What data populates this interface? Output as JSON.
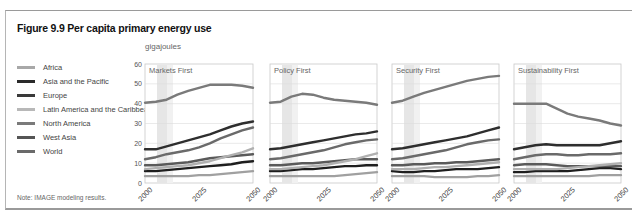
{
  "figure": {
    "title": "Figure 9.9 Per capita primary energy use",
    "unit_label": "gigajoules",
    "note": "Note: IMAGE modeling results."
  },
  "legend": [
    {
      "label": "Africa",
      "color": "#a8a8a8"
    },
    {
      "label": "Asia and the Pacific",
      "color": "#2a2a2a"
    },
    {
      "label": "Europe",
      "color": "#3a3a3a"
    },
    {
      "label": "Latin America and the Caribbean",
      "color": "#b8b8b8"
    },
    {
      "label": "North America",
      "color": "#7a7a7a"
    },
    {
      "label": "West Asia",
      "color": "#555555"
    },
    {
      "label": "World",
      "color": "#6a6a6a"
    }
  ],
  "chart_data": [
    {
      "type": "line",
      "title": "Markets First",
      "xlabel": "",
      "ylabel": "gigajoules",
      "x": [
        2000,
        2005,
        2010,
        2015,
        2020,
        2025,
        2030,
        2035,
        2040,
        2045,
        2050
      ],
      "xticks": [
        "2000",
        "2025",
        "2050"
      ],
      "yticks": [
        0,
        10,
        20,
        30,
        40,
        50,
        60
      ],
      "ylim": [
        0,
        60
      ],
      "grid": true,
      "series": [
        {
          "name": "North America",
          "values": [
            40.5,
            41,
            42,
            44.5,
            46.5,
            48,
            49.5,
            49.5,
            49.5,
            49,
            48
          ]
        },
        {
          "name": "Europe",
          "values": [
            17,
            17,
            18.5,
            20,
            21.5,
            23,
            24.5,
            26.5,
            28.5,
            30,
            31
          ]
        },
        {
          "name": "West Asia",
          "values": [
            12,
            13,
            14.5,
            15.5,
            16.5,
            18,
            20,
            22.5,
            24.5,
            26.5,
            28
          ]
        },
        {
          "name": "Latin America and the Caribbean",
          "values": [
            7,
            7.5,
            8,
            8.5,
            9,
            10,
            11,
            12.5,
            14,
            15.5,
            17.5
          ]
        },
        {
          "name": "World",
          "values": [
            9,
            9,
            9.5,
            10,
            10.5,
            11.5,
            12.5,
            13,
            13.5,
            14,
            14.5
          ]
        },
        {
          "name": "Asia and the Pacific",
          "values": [
            6,
            6,
            6.5,
            7,
            7.5,
            8,
            8.5,
            9,
            9.5,
            10.5,
            11
          ]
        },
        {
          "name": "Africa",
          "values": [
            3.5,
            3.5,
            3.5,
            3.5,
            3.5,
            4,
            4,
            4.5,
            5,
            5.5,
            6
          ]
        }
      ]
    },
    {
      "type": "line",
      "title": "Policy First",
      "x": [
        2000,
        2005,
        2010,
        2015,
        2020,
        2025,
        2030,
        2035,
        2040,
        2045,
        2050
      ],
      "xticks": [
        "2000",
        "2025",
        "2050"
      ],
      "ylim": [
        0,
        60
      ],
      "grid": true,
      "series": [
        {
          "name": "North America",
          "values": [
            40.5,
            41,
            43.5,
            45,
            44.5,
            43,
            42,
            41.5,
            41,
            40.5,
            39.5
          ]
        },
        {
          "name": "Europe",
          "values": [
            17,
            17.5,
            18.5,
            19.5,
            20.5,
            21.5,
            22.5,
            23.5,
            24.5,
            25,
            26
          ]
        },
        {
          "name": "West Asia",
          "values": [
            12,
            12.5,
            13.5,
            14.5,
            15.5,
            16.5,
            18,
            19.5,
            20.5,
            21.5,
            22
          ]
        },
        {
          "name": "Latin America and the Caribbean",
          "values": [
            7,
            7,
            7.5,
            8,
            8.5,
            9,
            10,
            11,
            12,
            13.5,
            15
          ]
        },
        {
          "name": "World",
          "values": [
            9,
            9,
            9.5,
            10,
            10,
            10.5,
            11,
            11.5,
            12,
            12,
            12
          ]
        },
        {
          "name": "Asia and the Pacific",
          "values": [
            6,
            6,
            6.5,
            7,
            7,
            7.5,
            8,
            8.5,
            8.5,
            9,
            9
          ]
        },
        {
          "name": "Africa",
          "values": [
            3.5,
            3.5,
            3.5,
            3.5,
            3.5,
            3.5,
            3.5,
            4,
            4.5,
            5,
            5.5
          ]
        }
      ]
    },
    {
      "type": "line",
      "title": "Security First",
      "x": [
        2000,
        2005,
        2010,
        2015,
        2020,
        2025,
        2030,
        2035,
        2040,
        2045,
        2050
      ],
      "xticks": [
        "2000",
        "2025",
        "2050"
      ],
      "ylim": [
        0,
        60
      ],
      "grid": true,
      "series": [
        {
          "name": "North America",
          "values": [
            40.5,
            41.5,
            43.5,
            45.5,
            47,
            48.5,
            50,
            51.5,
            52.5,
            53.5,
            54
          ]
        },
        {
          "name": "Europe",
          "values": [
            17,
            17.5,
            18.5,
            19.5,
            20.5,
            21.5,
            22.5,
            23.5,
            25,
            26.5,
            28
          ]
        },
        {
          "name": "West Asia",
          "values": [
            12,
            12.5,
            13.5,
            14.5,
            15.5,
            16.5,
            18,
            19.5,
            20.5,
            21.5,
            22
          ]
        },
        {
          "name": "Latin America and the Caribbean",
          "values": [
            7,
            7,
            7,
            7.5,
            8,
            8,
            8.5,
            9,
            9.5,
            10,
            10.5
          ]
        },
        {
          "name": "World",
          "values": [
            9,
            9,
            9.5,
            9.5,
            10,
            10,
            10.5,
            10.5,
            11,
            11.5,
            12
          ]
        },
        {
          "name": "Asia and the Pacific",
          "values": [
            6,
            5.5,
            5.5,
            6,
            6,
            6.5,
            7,
            7,
            7,
            7.5,
            8
          ]
        },
        {
          "name": "Africa",
          "values": [
            3.5,
            3.5,
            3.5,
            3.5,
            3,
            3,
            3,
            3,
            3.5,
            3.5,
            4
          ]
        }
      ]
    },
    {
      "type": "line",
      "title": "Sustainability First",
      "x": [
        2000,
        2005,
        2010,
        2015,
        2020,
        2025,
        2030,
        2035,
        2040,
        2045,
        2050
      ],
      "xticks": [
        "2000",
        "2025",
        "2050"
      ],
      "ylim": [
        0,
        60
      ],
      "grid": true,
      "series": [
        {
          "name": "North America",
          "values": [
            40,
            40,
            40,
            40,
            37.5,
            35,
            33.5,
            32.5,
            31.5,
            30,
            29
          ]
        },
        {
          "name": "Europe",
          "values": [
            17,
            18,
            19,
            19.5,
            19,
            19,
            19,
            19,
            19,
            20,
            21
          ]
        },
        {
          "name": "West Asia",
          "values": [
            12,
            13,
            14,
            14.5,
            14.5,
            14,
            14,
            14.5,
            14.5,
            14.5,
            15
          ]
        },
        {
          "name": "Latin America and the Caribbean",
          "values": [
            7,
            7,
            7,
            7,
            7,
            7.5,
            8,
            8.5,
            9,
            9.5,
            10
          ]
        },
        {
          "name": "World",
          "values": [
            9,
            9.5,
            9.5,
            9.5,
            9,
            8.5,
            8.5,
            8.5,
            8.5,
            8.5,
            8.5
          ]
        },
        {
          "name": "Asia and the Pacific",
          "values": [
            5.5,
            5.5,
            6,
            6,
            6,
            6,
            6.5,
            7,
            7.5,
            7.5,
            7
          ]
        },
        {
          "name": "Africa",
          "values": [
            3.5,
            3.5,
            3.5,
            3.5,
            3.5,
            3.5,
            3.5,
            3.5,
            4,
            4,
            4
          ]
        }
      ]
    }
  ],
  "series_colors": {
    "North America": "#7a7a7a",
    "Europe": "#2e2e2e",
    "West Asia": "#6a6a6a",
    "Latin America and the Caribbean": "#b0b0b0",
    "World": "#5a5a5a",
    "Asia and the Pacific": "#1e1e1e",
    "Africa": "#a0a0a0"
  }
}
